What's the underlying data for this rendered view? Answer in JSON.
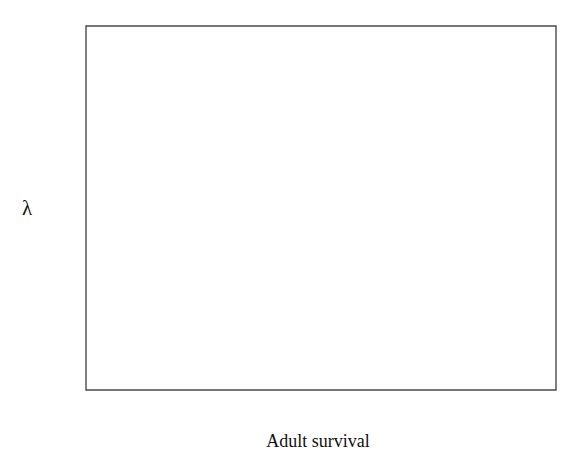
{
  "chart_data": {
    "type": "line",
    "title": "",
    "subtitle": "",
    "xlabel": "Adult survival",
    "ylabel": "λ",
    "xlim": [
      0.0,
      1.0
    ],
    "ylim": [
      0.0,
      1.2
    ],
    "grid": false,
    "legend": null,
    "legend_position": "none",
    "x_tick_labels": [
      "0.0",
      "0.2",
      "0.4",
      "0.6",
      "0.8",
      "1.0"
    ],
    "x_tick_values": [
      0.0,
      0.2,
      0.4,
      0.6,
      0.8,
      1.0
    ],
    "x_minor_tick_values": [
      0.1,
      0.3,
      0.5,
      0.7,
      0.9
    ],
    "y_tick_labels": [
      "0.0",
      "0.2",
      "0.4",
      "0.6",
      "0.8",
      "1.0",
      "1.2"
    ],
    "y_tick_values": [
      0.0,
      0.2,
      0.4,
      0.6,
      0.8,
      1.0,
      1.2
    ],
    "series": [
      {
        "name": "lambda",
        "color": "#1b1b1b",
        "x": [
          0.0,
          0.05,
          0.1,
          0.15,
          0.2,
          0.25,
          0.3,
          0.35,
          0.4,
          0.45,
          0.5,
          0.55,
          0.6,
          0.65,
          0.7,
          0.75,
          0.8,
          0.85,
          0.9,
          0.95,
          1.0
        ],
        "y": [
          0.461,
          0.481,
          0.501,
          0.521,
          0.542,
          0.563,
          0.585,
          0.607,
          0.63,
          0.653,
          0.677,
          0.702,
          0.727,
          0.753,
          0.78,
          0.808,
          0.836,
          0.866,
          0.897,
          0.994,
          1.095
        ]
      }
    ],
    "annotations": []
  },
  "axes": {
    "x_title": "Adult survival",
    "y_title": "λ"
  },
  "colors": {
    "line": "#1b1b1b",
    "axis": "#4a4a4a",
    "background": "#ffffff",
    "text": "#111111"
  }
}
